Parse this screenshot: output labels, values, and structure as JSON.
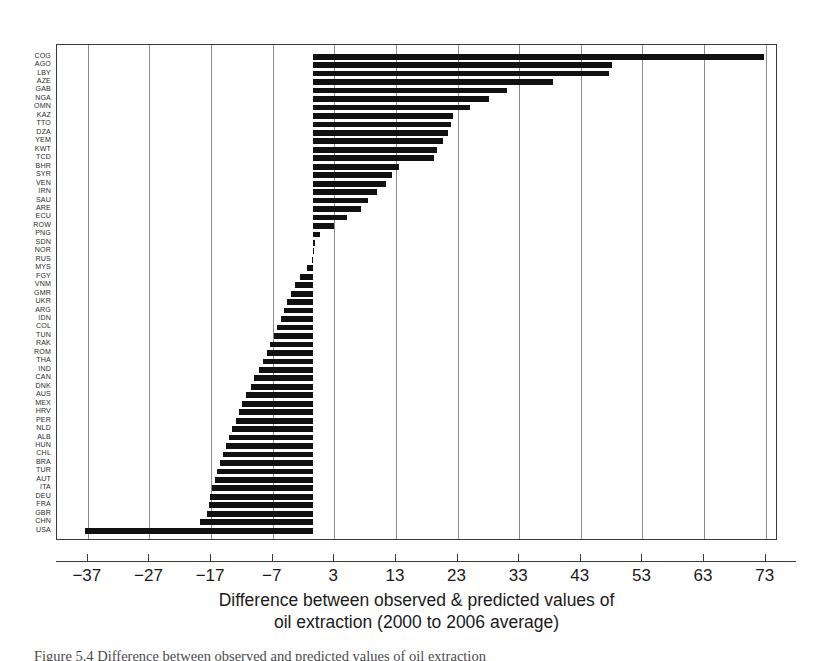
{
  "chart_data": {
    "type": "bar",
    "orientation": "horizontal",
    "title": "",
    "xlabel": "Difference between observed & predicted values of oil extraction (2000 to 2006 average)",
    "xlabel_lines": [
      "Difference between observed & predicted values of",
      "oil extraction (2000 to 2006 average)"
    ],
    "ylabel": "",
    "xlim": [
      -42,
      75
    ],
    "ylim": [
      0,
      62
    ],
    "xticks": [
      -37,
      -27,
      -17,
      -7,
      3,
      13,
      23,
      33,
      43,
      53,
      63,
      73
    ],
    "xtick_labels": [
      "-37",
      "-27",
      "-17",
      "-7",
      "3",
      "13",
      "23",
      "33",
      "43",
      "53",
      "63",
      "73"
    ],
    "grid": "vertical-only",
    "legend": "none",
    "bar_color": "#111111",
    "baseline": -0.4,
    "categories": [
      "COG",
      "AGO",
      "LBY",
      "AZE",
      "GAB",
      "NGA",
      "OMN",
      "KAZ",
      "TTO",
      "DZA",
      "YEM",
      "KWT",
      "TCD",
      "BHR",
      "SYR",
      "VEN",
      "IRN",
      "SAU",
      "ARE",
      "ECU",
      "ROW",
      "PNG",
      "SDN",
      "NOR",
      "RUS",
      "MYS",
      "FGY",
      "VNM",
      "GMR",
      "UKR",
      "ARG",
      "IDN",
      "COL",
      "TUN",
      "RAK",
      "ROM",
      "THA",
      "IND",
      "CAN",
      "DNK",
      "AUS",
      "MEX",
      "HRV",
      "PER",
      "NLD",
      "ALB",
      "HUN",
      "CHL",
      "BRA",
      "TUR",
      "AUT",
      "ITA",
      "DEU",
      "FRA",
      "GBR",
      "CHN",
      "USA"
    ],
    "values": [
      72.8,
      48.0,
      47.6,
      38.5,
      31.0,
      28.1,
      25.0,
      22.2,
      22.0,
      21.4,
      20.6,
      19.6,
      19.2,
      13.5,
      12.4,
      11.4,
      10.0,
      8.4,
      7.4,
      5.0,
      3.0,
      0.6,
      -0.1,
      -0.3,
      -0.6,
      -1.4,
      -2.6,
      -3.4,
      -4.0,
      -4.6,
      -5.2,
      -5.7,
      -6.3,
      -6.8,
      -7.4,
      -7.9,
      -8.5,
      -9.2,
      -10.0,
      -10.6,
      -11.3,
      -11.9,
      -12.4,
      -13.0,
      -13.6,
      -14.1,
      -14.6,
      -15.1,
      -15.5,
      -16.0,
      -16.4,
      -16.8,
      -17.1,
      -17.4,
      -17.7,
      -18.8,
      -37.5
    ],
    "note": "Bars extend from a common baseline just left of the 3 gridline; positive values extend right, negative values extend left."
  },
  "caption": {
    "text": "Figure 5.4  Difference between observed and predicted values of oil extraction"
  }
}
